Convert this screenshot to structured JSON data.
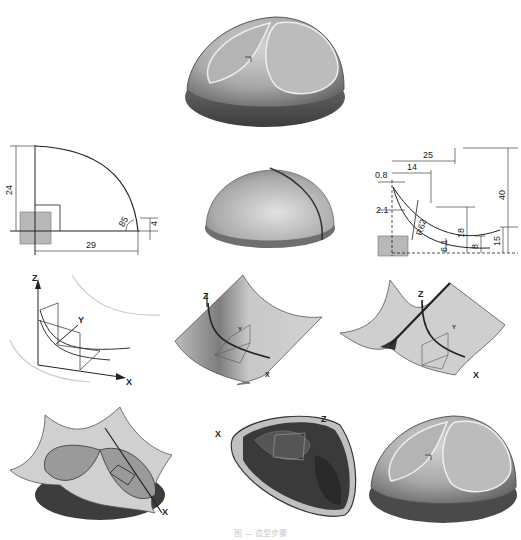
{
  "figure": {
    "caption": "图 — 造型步骤",
    "panels": [
      {
        "id": "final-part-top",
        "kind": "render",
        "description": "Finished knob: domed body with saddle-shaped recess and oval top face"
      },
      {
        "id": "sketch-profile-1",
        "kind": "sketch",
        "dimensions": {
          "height": "24",
          "width": "29",
          "angle": "85",
          "edge": "4"
        }
      },
      {
        "id": "revolved-dome",
        "kind": "render",
        "description": "Revolved dome with split line"
      },
      {
        "id": "sketch-profile-2",
        "kind": "sketch",
        "dimensions": {
          "d_25": "25",
          "d_14": "14",
          "d_0_8": "0.8",
          "d_2_1": "2.1",
          "radius": "R62",
          "d_18": "18",
          "d_6_1": "6.1",
          "d_8": "8",
          "d_15": "15",
          "d_40": "40"
        }
      },
      {
        "id": "curves-3d",
        "kind": "wireframe",
        "axes": [
          "Z",
          "Y",
          "X"
        ]
      },
      {
        "id": "swept-surface",
        "kind": "render",
        "axes": [
          "Z",
          "Y",
          "X"
        ]
      },
      {
        "id": "mirrored-surface",
        "kind": "render",
        "axes": [
          "Z",
          "Y",
          "X"
        ]
      },
      {
        "id": "trim-surfaces",
        "kind": "render",
        "axes": [
          "X"
        ]
      },
      {
        "id": "cut-body-bottom",
        "kind": "render",
        "axes": [
          "X",
          "Z"
        ]
      },
      {
        "id": "final-part-bottom",
        "kind": "render"
      }
    ]
  },
  "colors": {
    "ink": "#222222",
    "surface": "#c9c9c9",
    "surface_dark": "#6e6e6e",
    "sketch_fill": "#b8b8b8"
  }
}
